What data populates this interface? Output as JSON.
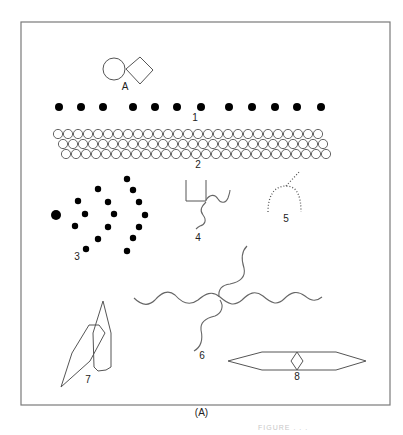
{
  "figure": {
    "panel_label": "(A)",
    "faded_caption": "FIGURE . . .",
    "frame": {
      "x": 21,
      "y": 22,
      "w": 369,
      "h": 383
    },
    "colors": {
      "stroke": "#555555",
      "dot": "#000000",
      "frame": "#7a7a7a"
    }
  },
  "items": {
    "A": {
      "label": "A",
      "circle": {
        "cx": 114,
        "cy": 69,
        "r": 11
      },
      "diamond": [
        [
          126,
          69
        ],
        [
          140,
          57
        ],
        [
          153,
          70
        ],
        [
          140,
          84
        ]
      ],
      "label_pos": [
        125,
        90
      ]
    },
    "1": {
      "label": "1",
      "y": 107,
      "r": 4,
      "xs": [
        59,
        81,
        103,
        133,
        155,
        177,
        201,
        229,
        252,
        275,
        297,
        321
      ],
      "label_pos": [
        195,
        121
      ]
    },
    "2": {
      "label": "2",
      "rows": [
        {
          "y": 134,
          "x0": 58,
          "count": 27
        },
        {
          "y": 144,
          "x0": 63,
          "count": 27
        },
        {
          "y": 154,
          "x0": 66,
          "count": 27
        }
      ],
      "r": 4.6,
      "spacing": 10,
      "label_pos": [
        198,
        168
      ]
    },
    "3": {
      "label": "3",
      "large_dot": {
        "cx": 56,
        "cy": 215,
        "r": 5
      },
      "dots": [
        [
          78,
          201
        ],
        [
          85,
          214
        ],
        [
          75,
          226
        ],
        [
          98,
          189
        ],
        [
          108,
          202
        ],
        [
          114,
          214
        ],
        [
          108,
          227
        ],
        [
          98,
          239
        ],
        [
          86,
          249
        ],
        [
          127,
          179
        ],
        [
          133,
          190
        ],
        [
          139,
          202
        ],
        [
          145,
          215
        ],
        [
          139,
          227
        ],
        [
          133,
          238
        ],
        [
          127,
          251
        ]
      ],
      "dot_r": 3.2,
      "label_pos": [
        77,
        260
      ]
    },
    "4": {
      "label": "4",
      "bracket": "M186 180 L186 201 L206 201 L206 180",
      "wave_right": "M206 200 C210 194 215 194 218 199 C221 204 226 203 228 198 C229 195 230 192 230 190",
      "wave_down": "M206 202 C202 206 199 210 203 215 C207 220 205 225 200 226 C198 227 197 228 196 229",
      "label_pos": [
        198,
        241
      ]
    },
    "5": {
      "label": "5",
      "arch": "M268 212 C268 196 274 186 286 186 C297 186 301 196 301 212",
      "stem": "M286 186 L300 171",
      "label_pos": [
        286,
        222
      ]
    },
    "6": {
      "label": "6",
      "wave_horizontal": "M134 298 C142 306 149 306 155 300 C161 293 168 289 175 295 C182 303 190 306 198 300 C205 294 212 290 220 297 C228 304 234 307 242 300 C249 293 255 290 263 296 C271 303 277 306 284 299 C291 292 297 290 305 296 C311 301 316 302 322 297",
      "wave_up": "M219 297 C218 289 222 285 230 284 C240 282 246 277 244 268 C241 259 241 252 247 246",
      "wave_down": "M220 300 C224 306 222 313 215 316 C206 318 200 322 201 330 C203 339 201 347 194 351",
      "label_pos": [
        202,
        359
      ]
    },
    "7": {
      "label": "7",
      "tall_hex": [
        [
          103,
          301
        ],
        [
          111,
          333
        ],
        [
          111,
          367
        ],
        [
          106,
          370
        ],
        [
          98,
          371
        ],
        [
          94,
          367
        ],
        [
          93,
          333
        ]
      ],
      "kite": [
        [
          61,
          387
        ],
        [
          72,
          353
        ],
        [
          89,
          325
        ],
        [
          99,
          325
        ],
        [
          105,
          333
        ],
        [
          90,
          361
        ]
      ],
      "label_pos": [
        88,
        383
      ]
    },
    "8": {
      "label": "8",
      "hexagon": [
        [
          228,
          361
        ],
        [
          262,
          352
        ],
        [
          336,
          352
        ],
        [
          366,
          361
        ],
        [
          336,
          370
        ],
        [
          262,
          370
        ]
      ],
      "diamond": [
        [
          297,
          352
        ],
        [
          303,
          361
        ],
        [
          297,
          370
        ],
        [
          291,
          361
        ]
      ],
      "label_pos": [
        297,
        380
      ]
    }
  }
}
